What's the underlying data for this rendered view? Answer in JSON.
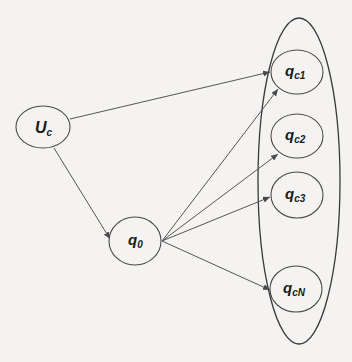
{
  "diagram": {
    "type": "directed-graph",
    "colors": {
      "background": "#f4f3f1",
      "stroke": "#4a4a4a",
      "text": "#1a1a1a"
    },
    "nodes": [
      {
        "id": "Uc",
        "label": "U",
        "sub": "c",
        "cx": 43,
        "cy": 127,
        "rx": 27,
        "ry": 21
      },
      {
        "id": "q0",
        "label": "q",
        "sub": "0",
        "cx": 135,
        "cy": 241,
        "rx": 26,
        "ry": 24
      },
      {
        "id": "qc1",
        "label": "q",
        "sub": "c1",
        "cx": 297,
        "cy": 72,
        "rx": 26,
        "ry": 22
      },
      {
        "id": "qc2",
        "label": "q",
        "sub": "c2",
        "cx": 297,
        "cy": 136,
        "rx": 26,
        "ry": 22
      },
      {
        "id": "qc3",
        "label": "q",
        "sub": "c3",
        "cx": 297,
        "cy": 195,
        "rx": 26,
        "ry": 23
      },
      {
        "id": "qcN",
        "label": "q",
        "sub": "cN",
        "cx": 296,
        "cy": 289,
        "rx": 26,
        "ry": 23
      }
    ],
    "group": {
      "label": "candidate set",
      "members": [
        "qc1",
        "qc2",
        "qc3",
        "qcN"
      ]
    },
    "edges": [
      {
        "from": "Uc",
        "to": "qc1"
      },
      {
        "from": "Uc",
        "to": "q0"
      },
      {
        "from": "q0",
        "to": "qc1"
      },
      {
        "from": "q0",
        "to": "qc2"
      },
      {
        "from": "q0",
        "to": "qc3"
      },
      {
        "from": "q0",
        "to": "qcN"
      }
    ]
  }
}
